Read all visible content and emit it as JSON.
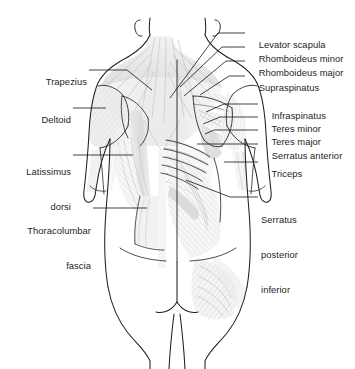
{
  "figure": {
    "view": "posterior",
    "background_color": "#ffffff",
    "line_color": "#231f20",
    "shading_color": "#c9cacb"
  },
  "labels": {
    "left": [
      {
        "name": "trapezius",
        "lines": [
          "Trapezius"
        ]
      },
      {
        "name": "deltoid",
        "lines": [
          "Deltoid"
        ]
      },
      {
        "name": "latissimus-dorsi",
        "lines": [
          "Latissimus",
          "dorsi"
        ]
      },
      {
        "name": "thoracolumbar-fascia",
        "lines": [
          "Thoracolumbar",
          "fascia"
        ]
      }
    ],
    "right": [
      {
        "name": "levator-scapula",
        "lines": [
          "Levator scapula"
        ]
      },
      {
        "name": "rhomboideus-minor",
        "lines": [
          "Rhomboideus minor"
        ]
      },
      {
        "name": "rhomboideus-major",
        "lines": [
          "Rhomboideus major"
        ]
      },
      {
        "name": "supraspinatus",
        "lines": [
          "Supraspinatus"
        ]
      },
      {
        "name": "infraspinatus",
        "lines": [
          "Infraspinatus"
        ]
      },
      {
        "name": "teres-minor",
        "lines": [
          "Teres minor"
        ]
      },
      {
        "name": "teres-major",
        "lines": [
          "Teres major"
        ]
      },
      {
        "name": "serratus-anterior",
        "lines": [
          "Serratus anterior"
        ]
      },
      {
        "name": "triceps",
        "lines": [
          "Triceps"
        ]
      },
      {
        "name": "serratus-posterior-inferior",
        "lines": [
          "Serratus",
          "posterior",
          "inferior"
        ]
      }
    ]
  },
  "label_text": {
    "trapezius": "Trapezius",
    "deltoid": "Deltoid",
    "latissimus_dorsi_1": "Latissimus",
    "latissimus_dorsi_2": "dorsi",
    "thoracolumbar_fascia_1": "Thoracolumbar",
    "thoracolumbar_fascia_2": "fascia",
    "levator_scapula": "Levator scapula",
    "rhomboideus_minor": "Rhomboideus minor",
    "rhomboideus_major": "Rhomboideus major",
    "supraspinatus": "Supraspinatus",
    "infraspinatus": "Infraspinatus",
    "teres_minor": "Teres minor",
    "teres_major": "Teres major",
    "serratus_anterior": "Serratus anterior",
    "triceps": "Triceps",
    "serratus_posterior_inferior_1": "Serratus",
    "serratus_posterior_inferior_2": "posterior",
    "serratus_posterior_inferior_3": "inferior"
  }
}
